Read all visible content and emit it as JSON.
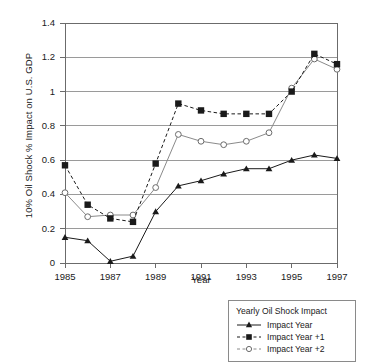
{
  "chart": {
    "ylabel": "10% Oil Shock % Impact on U.S. GDP",
    "xlabel": "Year",
    "legend_title": "Yearly Oil Shock Impact",
    "yticks": [
      "0",
      "0.2",
      "0.4",
      "0.6",
      "0.8",
      "1",
      "1.2",
      "1.4"
    ],
    "xticks": [
      "1985",
      "1987",
      "1989",
      "1991",
      "1993",
      "1995",
      "1997"
    ],
    "series_labels": {
      "s0": "Impact Year",
      "s1": "Impact Year +1",
      "s2": "Impact Year +2"
    },
    "colors": {
      "axis": "#6b6b6b",
      "grid": "#9a9a9a",
      "line_impact_year": "#1a1a1a",
      "line_impact_year_1": "#1a1a1a",
      "line_impact_year_2": "#8a8a8a",
      "background": "#ffffff"
    }
  },
  "chart_data": {
    "type": "line",
    "title": "",
    "xlabel": "Year",
    "ylabel": "10% Oil Shock % Impact on U.S. GDP",
    "legend_title": "Yearly Oil Shock Impact",
    "legend_position": "below-right",
    "grid": "horizontal",
    "xlim": [
      1985,
      1997
    ],
    "ylim": [
      0,
      1.4
    ],
    "ytick_step": 0.2,
    "xtick_step": 2,
    "x": [
      1985,
      1986,
      1987,
      1988,
      1989,
      1990,
      1991,
      1992,
      1993,
      1994,
      1995,
      1996,
      1997
    ],
    "series": [
      {
        "name": "Impact Year",
        "marker": "filled-triangle",
        "line": "solid",
        "color": "#1a1a1a",
        "values": [
          0.15,
          0.13,
          0.01,
          0.04,
          0.3,
          0.45,
          0.48,
          0.52,
          0.55,
          0.55,
          0.6,
          0.63,
          0.61
        ]
      },
      {
        "name": "Impact Year +1",
        "marker": "filled-square",
        "line": "dashed",
        "color": "#1a1a1a",
        "values": [
          0.57,
          0.34,
          0.26,
          0.24,
          0.58,
          0.93,
          0.89,
          0.87,
          0.87,
          0.87,
          1.0,
          1.22,
          1.16
        ]
      },
      {
        "name": "Impact Year +2",
        "marker": "open-circle",
        "line": "solid",
        "color": "#8a8a8a",
        "values": [
          0.41,
          0.27,
          0.28,
          0.28,
          0.44,
          0.75,
          0.71,
          0.69,
          0.71,
          0.76,
          1.02,
          1.19,
          1.13
        ]
      }
    ]
  }
}
